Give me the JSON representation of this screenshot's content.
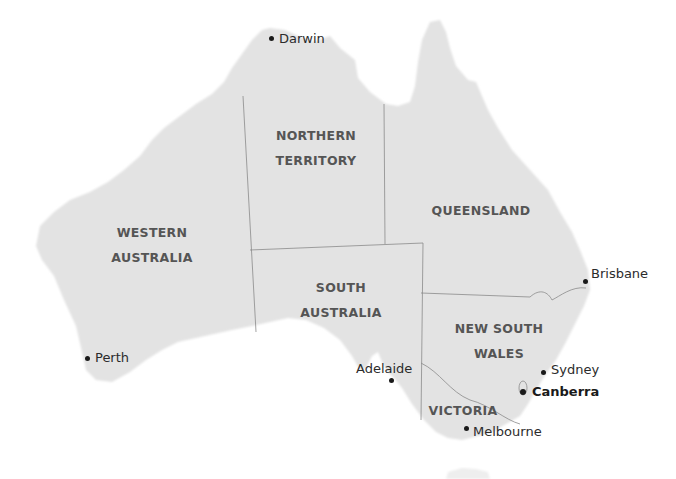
{
  "map": {
    "title": "Australia states and territories",
    "colors": {
      "land": "#e3e3e3",
      "border": "#8a8a8a",
      "water": "#ffffff",
      "state_label": "#555555",
      "city_label": "#2b2b2b"
    },
    "states": [
      {
        "id": "wa",
        "line1": "WESTERN",
        "line2": "AUSTRALIA",
        "x": 152,
        "y": 220
      },
      {
        "id": "nt",
        "line1": "NORTHERN",
        "line2": "TERRITORY",
        "x": 316,
        "y": 123
      },
      {
        "id": "qld",
        "line1": "QUEENSLAND",
        "line2": "",
        "x": 481,
        "y": 198
      },
      {
        "id": "sa",
        "line1": "SOUTH",
        "line2": "AUSTRALIA",
        "x": 341,
        "y": 275
      },
      {
        "id": "nsw",
        "line1": "NEW SOUTH",
        "line2": "WALES",
        "x": 499,
        "y": 316
      },
      {
        "id": "vic",
        "line1": "VICTORIA",
        "line2": "",
        "x": 463,
        "y": 398
      }
    ],
    "cities": [
      {
        "id": "darwin",
        "name": "Darwin",
        "dot_x": 271,
        "dot_y": 38,
        "label_x": 279,
        "label_y": 31,
        "capital": false
      },
      {
        "id": "perth",
        "name": "Perth",
        "dot_x": 87,
        "dot_y": 358,
        "label_x": 95,
        "label_y": 350,
        "capital": false
      },
      {
        "id": "adelaide",
        "name": "Adelaide",
        "dot_x": 392,
        "dot_y": 380,
        "label_x": 356,
        "label_y": 361,
        "capital": false
      },
      {
        "id": "brisbane",
        "name": "Brisbane",
        "dot_x": 585,
        "dot_y": 281,
        "label_x": 591,
        "label_y": 266,
        "capital": false
      },
      {
        "id": "sydney",
        "name": "Sydney",
        "dot_x": 543,
        "dot_y": 372,
        "label_x": 551,
        "label_y": 362,
        "capital": false
      },
      {
        "id": "canberra",
        "name": "Canberra",
        "dot_x": 522,
        "dot_y": 391,
        "label_x": 532,
        "label_y": 384,
        "capital": true
      },
      {
        "id": "melbourne",
        "name": "Melbourne",
        "dot_x": 466,
        "dot_y": 428,
        "label_x": 473,
        "label_y": 424,
        "capital": false
      }
    ]
  }
}
